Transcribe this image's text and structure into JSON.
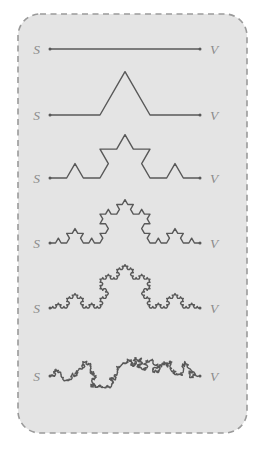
{
  "figure": {
    "colors": {
      "page_background": "#ffffff",
      "panel_background": "#e4e4e4",
      "panel_border": "#9a9a9a",
      "curve_stroke": "#585858",
      "label_text": "#8c8c8c"
    },
    "panel": {
      "x": 18,
      "y": 14,
      "width": 229,
      "height": 419,
      "corner_radius": 22,
      "border_style": "dashed"
    },
    "geometry": {
      "start_x": 50,
      "end_x": 200,
      "label_start_x": 40,
      "label_end_x": 210
    },
    "rows": [
      {
        "name": "iteration-0",
        "label_start": "S",
        "label_end": "V",
        "baseline_y": 49,
        "iterations": 0,
        "jitter": 0
      },
      {
        "name": "iteration-1",
        "label_start": "S",
        "label_end": "V",
        "baseline_y": 115,
        "iterations": 1,
        "jitter": 0
      },
      {
        "name": "iteration-2",
        "label_start": "S",
        "label_end": "V",
        "baseline_y": 178,
        "iterations": 2,
        "jitter": 0
      },
      {
        "name": "iteration-3",
        "label_start": "S",
        "label_end": "V",
        "baseline_y": 243,
        "iterations": 3,
        "jitter": 0
      },
      {
        "name": "iteration-4",
        "label_start": "S",
        "label_end": "V",
        "baseline_y": 308,
        "iterations": 4,
        "jitter": 0
      },
      {
        "name": "iteration-5-random",
        "label_start": "S",
        "label_end": "V",
        "baseline_y": 376,
        "iterations": 5,
        "jitter": 0.55
      }
    ]
  }
}
